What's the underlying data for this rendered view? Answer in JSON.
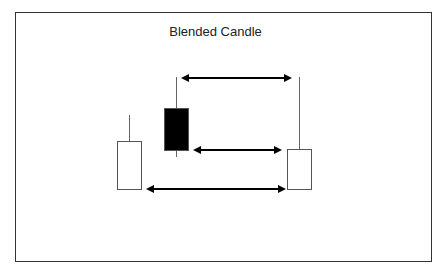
{
  "diagram": {
    "title": "Blended Candle",
    "candles": [
      {
        "name": "first-candle",
        "color": "white",
        "body": {
          "x": 117,
          "y": 141,
          "w": 24,
          "h": 48
        },
        "wick": {
          "x": 129,
          "top": 115,
          "bottom": 141
        }
      },
      {
        "name": "second-candle",
        "color": "black",
        "body": {
          "x": 164,
          "y": 108,
          "w": 24,
          "h": 42
        },
        "wick": {
          "x": 176,
          "top": 77,
          "bottom": 157
        }
      },
      {
        "name": "blended-candle",
        "color": "white",
        "body": {
          "x": 287,
          "y": 149,
          "w": 24,
          "h": 40
        },
        "wick": {
          "x": 299,
          "top": 77,
          "bottom": 149
        }
      }
    ],
    "arrows": [
      {
        "name": "high-arrow",
        "x1": 183,
        "x2": 290,
        "y": 78
      },
      {
        "name": "close-arrow",
        "x1": 195,
        "x2": 280,
        "y": 150
      },
      {
        "name": "open-arrow",
        "x1": 148,
        "x2": 284,
        "y": 189
      }
    ]
  }
}
